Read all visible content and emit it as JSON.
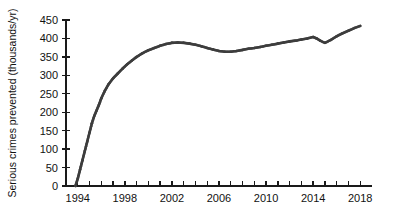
{
  "chart_data": {
    "type": "line",
    "title": "",
    "subtitle": "",
    "xlabel": "",
    "ylabel": "Serious crimes prevented (thousands/yr)",
    "xlim": [
      1993,
      2019
    ],
    "ylim": [
      0,
      450
    ],
    "grid": false,
    "legend": "none",
    "x_tick_labels": [
      "1994",
      "1998",
      "2002",
      "2006",
      "2010",
      "2014",
      "2018"
    ],
    "x_tick_values": [
      1994,
      1998,
      2002,
      2006,
      2010,
      2014,
      2018
    ],
    "x_minor_tick_interval": 1,
    "y_tick_labels": [
      "0",
      "50",
      "100",
      "150",
      "200",
      "250",
      "300",
      "350",
      "400",
      "450"
    ],
    "y_tick_values": [
      0,
      50,
      100,
      150,
      200,
      250,
      300,
      350,
      400,
      450
    ],
    "series": [
      {
        "name": "Serious crimes prevented",
        "color": "#3d3d3d",
        "marker": "dot",
        "x": [
          1993.8,
          1994.0,
          1994.2,
          1994.4,
          1994.6,
          1994.8,
          1995.0,
          1995.2,
          1995.4,
          1995.6,
          1995.8,
          1996.0,
          1996.3,
          1996.6,
          1997.0,
          1997.4,
          1997.8,
          1998.2,
          1998.6,
          1999.0,
          1999.5,
          2000.0,
          2000.5,
          2001.0,
          2001.5,
          2002.0,
          2002.5,
          2003.0,
          2003.5,
          2004.0,
          2004.5,
          2005.0,
          2005.5,
          2006.0,
          2006.5,
          2007.0,
          2007.5,
          2008.0,
          2008.5,
          2009.0,
          2009.5,
          2010.0,
          2010.5,
          2011.0,
          2011.5,
          2012.0,
          2012.5,
          2013.0,
          2013.5,
          2014.0,
          2014.3,
          2014.6,
          2015.0,
          2015.5,
          2016.0,
          2016.5,
          2017.0,
          2017.5,
          2018.0
        ],
        "y": [
          0,
          20,
          45,
          70,
          95,
          120,
          145,
          170,
          190,
          205,
          220,
          238,
          258,
          275,
          292,
          305,
          318,
          330,
          340,
          350,
          360,
          368,
          374,
          380,
          385,
          388,
          389,
          388,
          386,
          383,
          379,
          374,
          370,
          366,
          364,
          364,
          366,
          369,
          372,
          374,
          377,
          380,
          383,
          386,
          389,
          392,
          394,
          397,
          400,
          404,
          400,
          394,
          388,
          396,
          406,
          414,
          421,
          428,
          434
        ]
      }
    ],
    "annotations": []
  },
  "axes": {
    "y_axis_title": "Serious crimes prevented (thousands/yr)"
  }
}
